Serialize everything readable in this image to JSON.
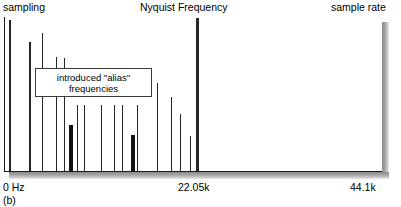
{
  "figure": {
    "caption": "(b)",
    "labels": {
      "sampling": "sampling",
      "nyquist": "Nyquist Frequency",
      "sample_rate": "sample rate"
    },
    "callout": {
      "line1": "introduced \"alias\"",
      "line2": "frequencies"
    },
    "axis": {
      "x_min_label": "0 Hz",
      "x_mid_label": "22.05k",
      "x_max_label": "44.1k"
    },
    "colors": {
      "spike": "#262626",
      "alias_spike": "#111111",
      "frame": "#1a1a1a",
      "background": "#ffffff",
      "shadow": "#8c8c8c"
    }
  },
  "chart_data": {
    "type": "bar",
    "title": "",
    "xlabel": "",
    "ylabel": "",
    "xlim": [
      0,
      44100
    ],
    "ylim": [
      0,
      1
    ],
    "grid": false,
    "legend": null,
    "x_ticks": [
      0,
      22050,
      44100
    ],
    "x_tick_labels": [
      "0 Hz",
      "22.05k",
      "44.1k"
    ],
    "annotations": [
      {
        "text": "sampling",
        "x": 0,
        "y": 1.0
      },
      {
        "text": "Nyquist Frequency",
        "x": 22050,
        "y": 1.0
      },
      {
        "text": "sample rate",
        "x": 44100,
        "y": 1.0
      },
      {
        "text": "introduced \"alias\" frequencies",
        "x": 5500,
        "y": 0.62
      }
    ],
    "series": [
      {
        "name": "signal harmonics",
        "kind": "original",
        "points": [
          {
            "x_px": 5,
            "freq_hz": 120,
            "amplitude": 0.985,
            "width_px": 2.0
          },
          {
            "x_px": 25,
            "freq_hz": 2440,
            "amplitude": 0.84,
            "width_px": 2.0
          },
          {
            "x_px": 38,
            "freq_hz": 4000,
            "amplitude": 0.9,
            "width_px": 1.5
          },
          {
            "x_px": 52,
            "freq_hz": 5650,
            "amplitude": 0.74,
            "width_px": 1.5
          },
          {
            "x_px": 60,
            "freq_hz": 6600,
            "amplitude": 0.735,
            "width_px": 1.5
          },
          {
            "x_px": 73,
            "freq_hz": 8150,
            "amplitude": 0.43,
            "width_px": 1.5
          },
          {
            "x_px": 80,
            "freq_hz": 8980,
            "amplitude": 0.43,
            "width_px": 1.5
          },
          {
            "x_px": 97,
            "freq_hz": 11000,
            "amplitude": 0.43,
            "width_px": 1.5
          },
          {
            "x_px": 110,
            "freq_hz": 12550,
            "amplitude": 0.43,
            "width_px": 1.5
          },
          {
            "x_px": 118,
            "freq_hz": 13500,
            "amplitude": 0.43,
            "width_px": 1.5
          },
          {
            "x_px": 133,
            "freq_hz": 15300,
            "amplitude": 0.43,
            "width_px": 1.5
          },
          {
            "x_px": 153,
            "freq_hz": 17650,
            "amplitude": 0.575,
            "width_px": 1.5
          },
          {
            "x_px": 167,
            "freq_hz": 19300,
            "amplitude": 0.48,
            "width_px": 1.5
          },
          {
            "x_px": 176,
            "freq_hz": 20380,
            "amplitude": 0.37,
            "width_px": 1.5
          },
          {
            "x_px": 186,
            "freq_hz": 21550,
            "amplitude": 0.225,
            "width_px": 1.5
          }
        ]
      },
      {
        "name": "introduced alias frequencies",
        "kind": "alias",
        "points": [
          {
            "x_px": 65,
            "freq_hz": 7180,
            "amplitude": 0.3,
            "width_px": 4.0
          },
          {
            "x_px": 127,
            "freq_hz": 14600,
            "amplitude": 0.235,
            "width_px": 4.0
          }
        ]
      },
      {
        "name": "nyquist marker",
        "kind": "nyquist",
        "points": [
          {
            "x_px": 192,
            "freq_hz": 22050,
            "amplitude": 1.0,
            "width_px": 3.5
          }
        ]
      }
    ]
  }
}
